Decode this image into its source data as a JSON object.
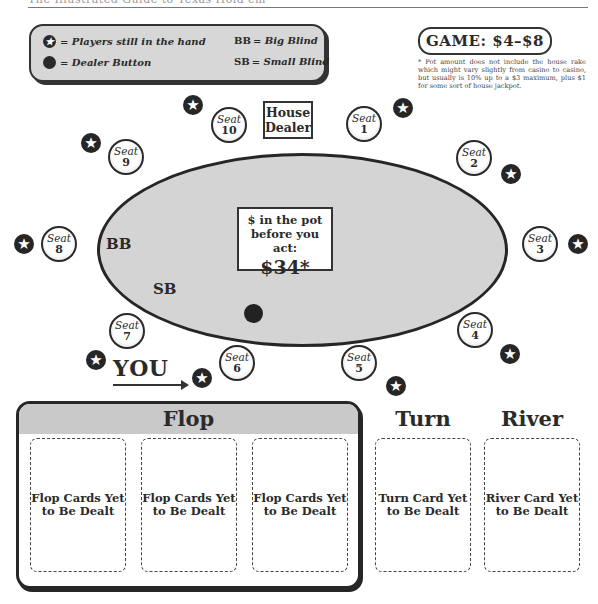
{
  "header": {
    "text": "The Illustrated Guide to Texas Hold'em"
  },
  "legend": {
    "players_in_hand": "= Players still in the hand",
    "dealer_button": "= Dealer Button",
    "bb_key": "BB",
    "bb_text": "= Big Blind",
    "sb_key": "SB",
    "sb_text": "= Small Blind"
  },
  "game": {
    "label": "GAME: $4–$8",
    "footnote": "* Pot amount does not include the house rake which might vary slightly from casino to casino, but usually is 10% up to a $3 maximum, plus $1 for some sort of house jackpot."
  },
  "table": {
    "house_dealer": "House Dealer",
    "pot_label": "$ in the pot before you act:",
    "pot_amount": "$34*",
    "bb_label": "BB",
    "sb_label": "SB",
    "you_label": "YOU"
  },
  "seats": [
    {
      "word": "Seat",
      "num": "1"
    },
    {
      "word": "Seat",
      "num": "2"
    },
    {
      "word": "Seat",
      "num": "3"
    },
    {
      "word": "Seat",
      "num": "4"
    },
    {
      "word": "Seat",
      "num": "5"
    },
    {
      "word": "Seat",
      "num": "6"
    },
    {
      "word": "Seat",
      "num": "7"
    },
    {
      "word": "Seat",
      "num": "8"
    },
    {
      "word": "Seat",
      "num": "9"
    },
    {
      "word": "Seat",
      "num": "10"
    }
  ],
  "board": {
    "flop_title": "Flop",
    "turn_title": "Turn",
    "river_title": "River",
    "flop_cards": [
      "Flop Cards Yet to Be Dealt",
      "Flop Cards Yet to Be Dealt",
      "Flop Cards Yet to Be Dealt"
    ],
    "turn_card": "Turn Card Yet to Be Dealt",
    "river_card": "River Card Yet to Be Dealt"
  },
  "icons": {
    "player_marker": "star-icon",
    "dealer_button": "filled-circle-icon"
  },
  "colors": {
    "table_felt": "#d4d4d4",
    "legend_bg": "#d7d7d7",
    "flop_header": "#c9c9c9",
    "ink": "#262626"
  }
}
